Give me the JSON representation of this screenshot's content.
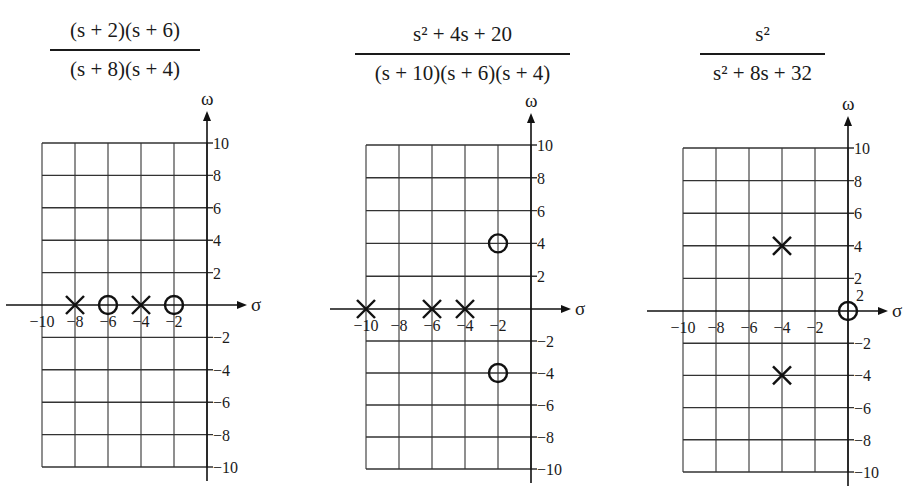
{
  "panels": [
    {
      "numerator": "(s + 2)(s + 6)",
      "denominator": "(s + 8)(s + 4)",
      "poles": [
        [
          -8,
          0
        ],
        [
          -4,
          0
        ]
      ],
      "zeros": [
        [
          -6,
          0
        ],
        [
          -2,
          0
        ]
      ]
    },
    {
      "numerator": "s² + 4s + 20",
      "denominator": "(s + 10)(s + 6)(s + 4)",
      "poles": [
        [
          -10,
          0
        ],
        [
          -6,
          0
        ],
        [
          -4,
          0
        ]
      ],
      "zeros": [
        [
          -2,
          4
        ],
        [
          -2,
          -4
        ]
      ]
    },
    {
      "numerator": "s²",
      "denominator": "s² + 8s + 32",
      "poles": [
        [
          -4,
          4
        ],
        [
          -4,
          -4
        ]
      ],
      "zeros": [
        [
          0,
          0
        ]
      ],
      "zero_multiplicity_label": "2"
    }
  ],
  "axes": {
    "x_label": "σ",
    "y_label": "ω",
    "x_ticks": [
      "−10",
      "−8",
      "−6",
      "−4",
      "−2"
    ],
    "y_ticks_pos": [
      "10",
      "8",
      "6",
      "4",
      "2"
    ],
    "y_ticks_neg": [
      "−2",
      "−4",
      "−6",
      "−8",
      "−10"
    ]
  },
  "chart_data": [
    {
      "type": "scatter",
      "title": "(s + 2)(s + 6) / (s + 8)(s + 4)",
      "xlabel": "σ",
      "ylabel": "ω",
      "xlim": [
        -10,
        0
      ],
      "ylim": [
        -10,
        10
      ],
      "grid": true,
      "series": [
        {
          "name": "poles (×)",
          "x": [
            -8,
            -4
          ],
          "y": [
            0,
            0
          ]
        },
        {
          "name": "zeros (○)",
          "x": [
            -6,
            -2
          ],
          "y": [
            0,
            0
          ]
        }
      ]
    },
    {
      "type": "scatter",
      "title": "(s² + 4s + 20) / (s + 10)(s + 6)(s + 4)",
      "xlabel": "σ",
      "ylabel": "ω",
      "xlim": [
        -10,
        0
      ],
      "ylim": [
        -10,
        10
      ],
      "grid": true,
      "series": [
        {
          "name": "poles (×)",
          "x": [
            -10,
            -6,
            -4
          ],
          "y": [
            0,
            0,
            0
          ]
        },
        {
          "name": "zeros (○)",
          "x": [
            -2,
            -2
          ],
          "y": [
            4,
            -4
          ]
        }
      ]
    },
    {
      "type": "scatter",
      "title": "s² / (s² + 8s + 32)",
      "xlabel": "σ",
      "ylabel": "ω",
      "xlim": [
        -10,
        0
      ],
      "ylim": [
        -10,
        10
      ],
      "grid": true,
      "series": [
        {
          "name": "poles (×)",
          "x": [
            -4,
            -4
          ],
          "y": [
            4,
            -4
          ]
        },
        {
          "name": "zeros (○)",
          "x": [
            0
          ],
          "y": [
            0
          ],
          "annotation": "2 (double zero)"
        }
      ]
    }
  ]
}
